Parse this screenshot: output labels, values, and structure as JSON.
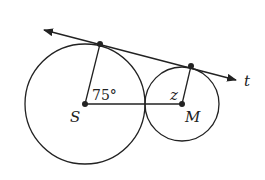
{
  "diagram": {
    "circle_large": {
      "center_label": "S",
      "cx": 85,
      "cy": 104,
      "r": 60
    },
    "circle_small": {
      "center_label": "M",
      "cx": 182,
      "cy": 104,
      "r": 37
    },
    "tangent_line": {
      "label": "t",
      "x1": 44,
      "y1": 30,
      "x2": 236,
      "y2": 80
    },
    "tangent_point_large": {
      "x": 100,
      "y": 44
    },
    "tangent_point_small": {
      "x": 191,
      "y": 66
    },
    "angle_label": "75°",
    "unknown_angle_label": "z",
    "stroke_color": "#222222",
    "background": "#ffffff"
  }
}
